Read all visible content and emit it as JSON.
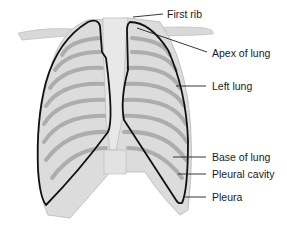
{
  "diagram": {
    "labels": [
      {
        "id": "first-rib",
        "text": "First rib",
        "x": 207,
        "y": 10
      },
      {
        "id": "apex-of-lung",
        "text": "Apex of lung",
        "x": 213,
        "y": 48
      },
      {
        "id": "left-lung",
        "text": "Left lung",
        "x": 212,
        "y": 81
      },
      {
        "id": "base-of-lung",
        "text": "Base of lung",
        "x": 212,
        "y": 151
      },
      {
        "id": "pleural-cavity",
        "text": "Pleural cavity",
        "x": 212,
        "y": 169
      },
      {
        "id": "pleura",
        "text": "Pleura",
        "x": 212,
        "y": 192
      }
    ],
    "colors": {
      "bone": "#d9d9d9",
      "bone_shadow": "#a8a8a8",
      "outline": "#111111",
      "leader": "#222222",
      "background": "#ffffff"
    }
  }
}
